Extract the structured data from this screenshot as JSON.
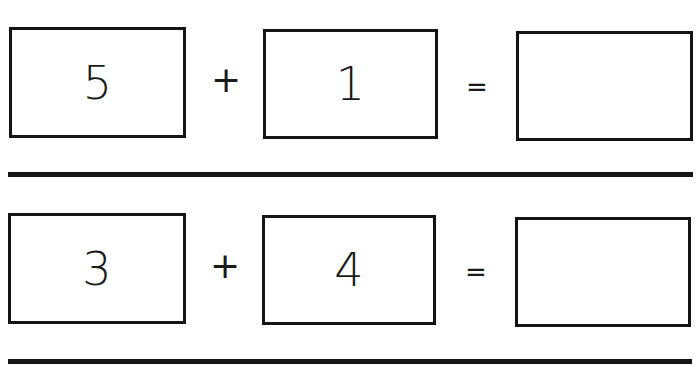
{
  "worksheet": {
    "problems": [
      {
        "addend1": "5",
        "operator": "+",
        "addend2": "1",
        "equals": "=",
        "answer": ""
      },
      {
        "addend1": "3",
        "operator": "+",
        "addend2": "4",
        "equals": "=",
        "answer": ""
      }
    ]
  }
}
